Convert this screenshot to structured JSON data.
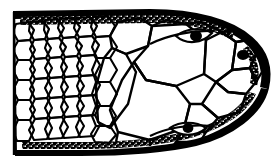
{
  "figure": {
    "title": "Dorsal view of reptile head scalation",
    "caption": "",
    "background_color": "#ffffff",
    "ink_color": "#000000",
    "width": 279,
    "height": 166,
    "orientation": "snout to the right, neck truncated at left edge",
    "style": "black-and-white pen-and-ink line drawing with stippled margins"
  },
  "anatomy": {
    "parts": [
      {
        "name": "neck-scales-region",
        "label": "Small imbricate neck scales",
        "description": "Dense field of small irregular polygonal scales in oblique rows occupying the left third"
      },
      {
        "name": "parietal-plate",
        "label": "Parietal",
        "description": "Large central plate"
      },
      {
        "name": "frontal-plate",
        "label": "Frontal",
        "description": "Large plate anterior to parietals"
      },
      {
        "name": "supraocular-plate",
        "label": "Supraocular",
        "description": "Plate above each eye"
      },
      {
        "name": "rostral-plate",
        "label": "Rostral",
        "description": "Terminal snout plate at right tip"
      },
      {
        "name": "eye-upper",
        "label": "Eye (right side)",
        "description": "Almond-shaped orbit with solid black pupil, upper margin"
      },
      {
        "name": "eye-lower",
        "label": "Eye (left side)",
        "description": "Almond-shaped orbit with solid black pupil, lower margin"
      },
      {
        "name": "nostril",
        "label": "Nostril",
        "description": "Small solid black spot near the snout tip, upper margin"
      },
      {
        "name": "stippled-margin",
        "label": "Stippled lateral margin",
        "description": "Heavy black band with white stipple along upper and lower outlines"
      }
    ]
  },
  "colors": {
    "ink": "#000000",
    "paper": "#ffffff",
    "pupil": "#000000"
  },
  "markings": {
    "eye_count": 2,
    "nostril_count": 1,
    "small_scale_count_approx": 96,
    "large_plate_count_approx": 18
  }
}
